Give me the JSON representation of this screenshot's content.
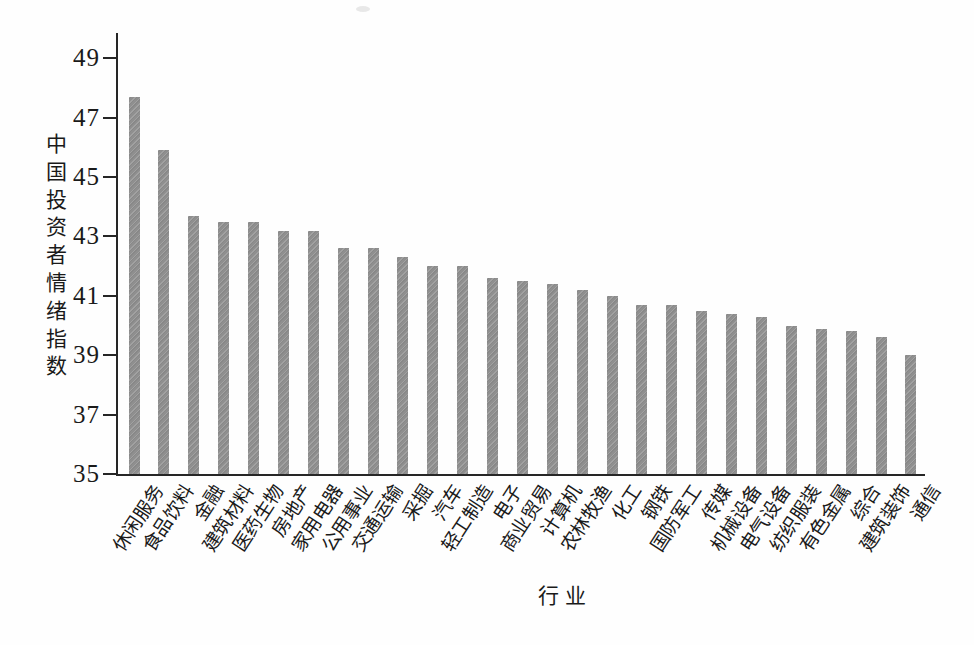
{
  "chart_data": {
    "type": "bar",
    "title": "",
    "xlabel": "行业",
    "ylabel": "中国投资者情绪指数",
    "ylim": [
      35,
      49
    ],
    "yticks": [
      35,
      37,
      39,
      41,
      43,
      45,
      47,
      49
    ],
    "grid": false,
    "legend": "none",
    "bar_color": "#8f8f8f",
    "axis_color": "#262626",
    "text_color": "#1a1a1a",
    "categories": [
      "休闲服务",
      "食品饮料",
      "金融",
      "建筑材料",
      "医药生物",
      "房地产",
      "家用电器",
      "公用事业",
      "交通运输",
      "采掘",
      "汽车",
      "轻工制造",
      "电子",
      "商业贸易",
      "计算机",
      "农林牧渔",
      "化工",
      "钢铁",
      "国防军工",
      "传媒",
      "机械设备",
      "电气设备",
      "纺织服装",
      "有色金属",
      "综合",
      "建筑装饰",
      "通信"
    ],
    "values": [
      47.7,
      45.9,
      43.7,
      43.5,
      43.5,
      43.2,
      43.2,
      42.6,
      42.6,
      42.3,
      42.0,
      42.0,
      41.6,
      41.5,
      41.4,
      41.2,
      41.0,
      40.7,
      40.7,
      40.5,
      40.4,
      40.3,
      40.0,
      39.9,
      39.8,
      39.6,
      39.0
    ]
  }
}
